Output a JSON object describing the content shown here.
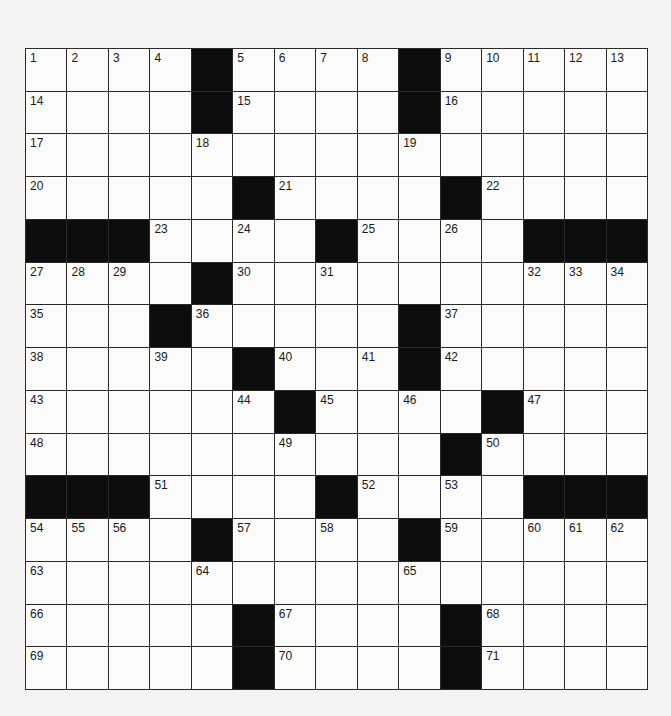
{
  "puzzle": {
    "size": {
      "rows": 15,
      "cols": 15
    },
    "colors": {
      "block": "#0d0d0d",
      "cell": "#fbfbfa",
      "line": "#2a2a2a",
      "background": "#f4f3f1"
    },
    "grid": [
      [
        "1",
        "2",
        "3",
        "4",
        "#",
        "5",
        "6",
        "7",
        "8",
        "#",
        "9",
        "10",
        "11",
        "12",
        "13"
      ],
      [
        "14",
        "",
        "",
        "",
        "#",
        "15",
        "",
        "",
        "",
        "#",
        "16",
        "",
        "",
        "",
        ""
      ],
      [
        "17",
        "",
        "",
        "",
        "18",
        "",
        "",
        "",
        "",
        "19",
        "",
        "",
        "",
        "",
        ""
      ],
      [
        "20",
        "",
        "",
        "",
        "",
        "#",
        "21",
        "",
        "",
        "",
        "#",
        "22",
        "",
        "",
        ""
      ],
      [
        "#",
        "#",
        "#",
        "23",
        "",
        "24",
        "",
        "#",
        "25",
        "",
        "26",
        "",
        "#",
        "#",
        "#"
      ],
      [
        "27",
        "28",
        "29",
        "",
        "#",
        "30",
        "",
        "31",
        "",
        "",
        "",
        "",
        "32",
        "33",
        "34"
      ],
      [
        "35",
        "",
        "",
        "#",
        "36",
        "",
        "",
        "",
        "",
        "#",
        "37",
        "",
        "",
        "",
        ""
      ],
      [
        "38",
        "",
        "",
        "39",
        "",
        "#",
        "40",
        "",
        "41",
        "#",
        "42",
        "",
        "",
        "",
        ""
      ],
      [
        "43",
        "",
        "",
        "",
        "",
        "44",
        "#",
        "45",
        "",
        "46",
        "",
        "#",
        "47",
        "",
        ""
      ],
      [
        "48",
        "",
        "",
        "",
        "",
        "",
        "49",
        "",
        "",
        "",
        "#",
        "50",
        "",
        "",
        ""
      ],
      [
        "#",
        "#",
        "#",
        "51",
        "",
        "",
        "",
        "#",
        "52",
        "",
        "53",
        "",
        "#",
        "#",
        "#"
      ],
      [
        "54",
        "55",
        "56",
        "",
        "#",
        "57",
        "",
        "58",
        "",
        "#",
        "59",
        "",
        "60",
        "61",
        "62"
      ],
      [
        "63",
        "",
        "",
        "",
        "64",
        "",
        "",
        "",
        "",
        "65",
        "",
        "",
        "",
        "",
        ""
      ],
      [
        "66",
        "",
        "",
        "",
        "",
        "#",
        "67",
        "",
        "",
        "",
        "#",
        "68",
        "",
        "",
        ""
      ],
      [
        "69",
        "",
        "",
        "",
        "",
        "#",
        "70",
        "",
        "",
        "",
        "#",
        "71",
        "",
        "",
        ""
      ]
    ]
  }
}
